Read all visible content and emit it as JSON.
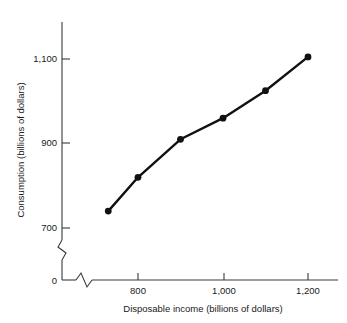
{
  "chart_data": {
    "type": "line",
    "title": "",
    "xlabel": "Disposable income (billions of dollars)",
    "ylabel": "Consumption (billions of dollars)",
    "x": [
      730,
      800,
      900,
      1000,
      1100,
      1200
    ],
    "values": [
      740,
      820,
      910,
      960,
      1025,
      1105
    ],
    "series": [
      {
        "name": "Consumption",
        "values": [
          740,
          820,
          910,
          960,
          1025,
          1105
        ]
      }
    ],
    "xlim": [
      700,
      1240
    ],
    "ylim": [
      690,
      1160
    ],
    "x_ticks": [
      800,
      1000,
      1200
    ],
    "x_tick_labels": [
      "800",
      "1,000",
      "1,200"
    ],
    "y_ticks": [
      700,
      900,
      1100
    ],
    "y_tick_labels": [
      "700",
      "900",
      "1,100"
    ],
    "origin_label": "0",
    "grid": false,
    "legend": "none",
    "axis_break_x": true,
    "axis_break_y": true,
    "line_color": "#111111",
    "marker_color": "#111111",
    "axis_color": "#3a3a3a",
    "background_color": "#ffffff"
  },
  "axes": {
    "y_label_text": "Consumption (billions of dollars)",
    "x_label_text": "Disposable income (billions of dollars)",
    "y_tick_1": "1,100",
    "y_tick_2": "900",
    "y_tick_3": "700",
    "origin": "0",
    "x_tick_1": "800",
    "x_tick_2": "1,000",
    "x_tick_3": "1,200"
  }
}
